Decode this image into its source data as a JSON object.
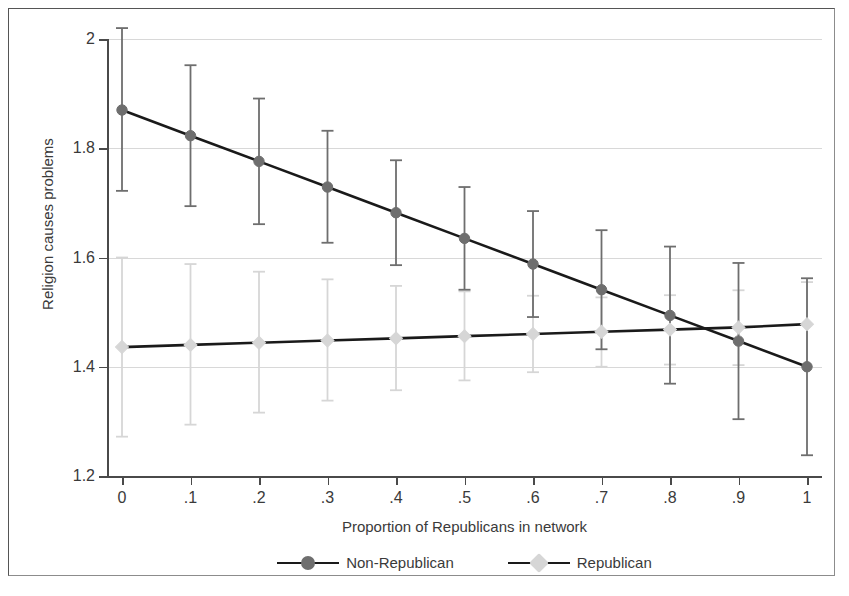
{
  "figure": {
    "ylabel": "Religion causes problems",
    "xlabel": "Proportion of Republicans in network",
    "ytick_labels": [
      "2",
      "1.8",
      "1.6",
      "1.4",
      "1.2"
    ],
    "xtick_labels": [
      "0",
      ".1",
      ".2",
      ".3",
      ".4",
      ".5",
      ".6",
      ".7",
      ".8",
      ".9",
      "1"
    ],
    "colors": {
      "non_republican": "#6e6e6e",
      "republican": "#d6d6d6",
      "line": "#1a1a1a",
      "axis": "#4a4a4a",
      "grid": "#d8d8d8",
      "text": "#3a3a3a",
      "background": "#ffffff"
    }
  },
  "legend": {
    "entries": [
      {
        "label": "Non-Republican",
        "marker": "circle",
        "color": "#6e6e6e"
      },
      {
        "label": "Republican",
        "marker": "diamond",
        "color": "#d6d6d6"
      }
    ]
  },
  "chart_data": {
    "type": "line",
    "title": "",
    "xlabel": "Proportion of Republicans in network",
    "ylabel": "Religion causes problems",
    "xlim": [
      0,
      1
    ],
    "ylim": [
      1.2,
      2.0
    ],
    "grid": true,
    "grid_y": [
      2.0,
      1.8,
      1.6,
      1.4,
      1.2
    ],
    "legend_position": "bottom-center",
    "x": [
      0,
      0.1,
      0.2,
      0.3,
      0.4,
      0.5,
      0.6,
      0.7,
      0.8,
      0.9,
      1.0
    ],
    "series": [
      {
        "name": "Non-Republican",
        "marker": "circle",
        "color": "#6e6e6e",
        "values": [
          1.87,
          1.823,
          1.776,
          1.729,
          1.682,
          1.635,
          1.588,
          1.541,
          1.494,
          1.447,
          1.4
        ],
        "ci_lower": [
          1.722,
          1.694,
          1.661,
          1.627,
          1.586,
          1.541,
          1.491,
          1.432,
          1.369,
          1.304,
          1.238
        ],
        "ci_upper": [
          2.02,
          1.952,
          1.891,
          1.832,
          1.778,
          1.729,
          1.685,
          1.65,
          1.62,
          1.59,
          1.562
        ]
      },
      {
        "name": "Republican",
        "marker": "diamond",
        "color": "#d6d6d6",
        "values": [
          1.436,
          1.44,
          1.444,
          1.448,
          1.452,
          1.456,
          1.46,
          1.464,
          1.468,
          1.472,
          1.478
        ],
        "ci_lower": [
          1.272,
          1.294,
          1.316,
          1.338,
          1.357,
          1.375,
          1.39,
          1.4,
          1.404,
          1.403,
          1.4
        ],
        "ci_upper": [
          1.6,
          1.588,
          1.574,
          1.56,
          1.548,
          1.538,
          1.53,
          1.527,
          1.531,
          1.54,
          1.555
        ]
      }
    ]
  }
}
